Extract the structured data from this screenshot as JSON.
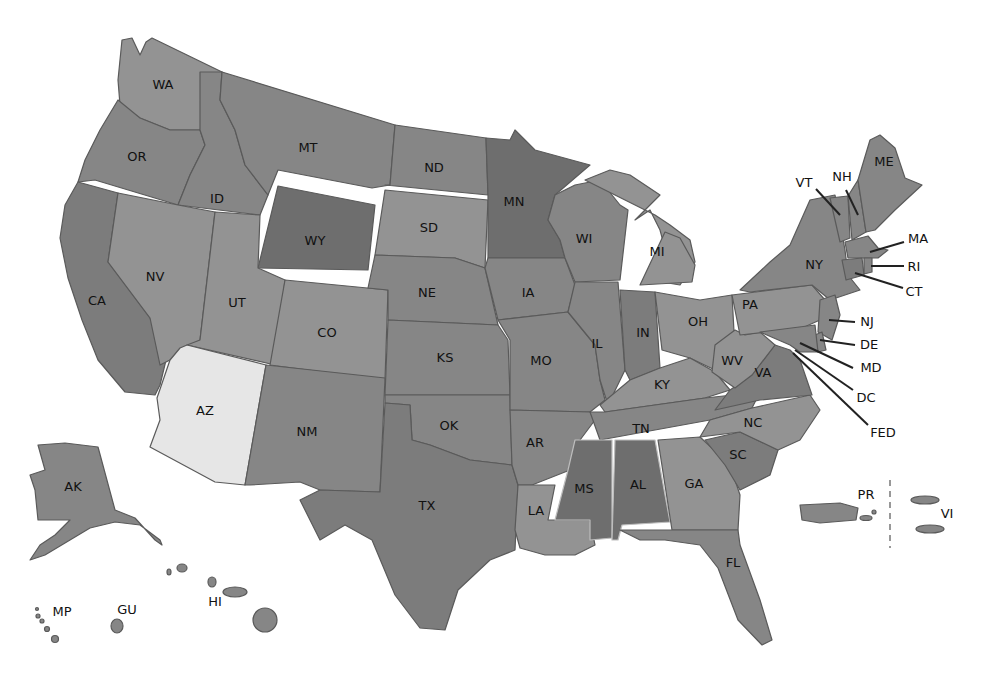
{
  "map": {
    "title": "",
    "shades": {
      "darkest": "#6e6e6e",
      "dark": "#7c7c7c",
      "medium": "#868686",
      "light": "#939393",
      "lightest": "#e6e6e6"
    },
    "states": [
      {
        "code": "WA",
        "shade": "light"
      },
      {
        "code": "OR",
        "shade": "medium"
      },
      {
        "code": "CA",
        "shade": "dark"
      },
      {
        "code": "ID",
        "shade": "medium"
      },
      {
        "code": "NV",
        "shade": "light"
      },
      {
        "code": "MT",
        "shade": "medium"
      },
      {
        "code": "WY",
        "shade": "darkest"
      },
      {
        "code": "UT",
        "shade": "light"
      },
      {
        "code": "AZ",
        "shade": "lightest"
      },
      {
        "code": "CO",
        "shade": "light"
      },
      {
        "code": "NM",
        "shade": "medium"
      },
      {
        "code": "ND",
        "shade": "medium"
      },
      {
        "code": "SD",
        "shade": "light"
      },
      {
        "code": "NE",
        "shade": "medium"
      },
      {
        "code": "KS",
        "shade": "medium"
      },
      {
        "code": "OK",
        "shade": "medium"
      },
      {
        "code": "TX",
        "shade": "dark"
      },
      {
        "code": "MN",
        "shade": "darkest"
      },
      {
        "code": "IA",
        "shade": "medium"
      },
      {
        "code": "MO",
        "shade": "medium"
      },
      {
        "code": "AR",
        "shade": "medium"
      },
      {
        "code": "LA",
        "shade": "light"
      },
      {
        "code": "WI",
        "shade": "medium"
      },
      {
        "code": "IL",
        "shade": "medium"
      },
      {
        "code": "MI",
        "shade": "light"
      },
      {
        "code": "IN",
        "shade": "dark"
      },
      {
        "code": "OH",
        "shade": "light"
      },
      {
        "code": "KY",
        "shade": "light"
      },
      {
        "code": "TN",
        "shade": "medium"
      },
      {
        "code": "MS",
        "shade": "darkest"
      },
      {
        "code": "AL",
        "shade": "darkest"
      },
      {
        "code": "GA",
        "shade": "light"
      },
      {
        "code": "FL",
        "shade": "medium"
      },
      {
        "code": "SC",
        "shade": "dark"
      },
      {
        "code": "NC",
        "shade": "light"
      },
      {
        "code": "VA",
        "shade": "dark"
      },
      {
        "code": "WV",
        "shade": "light"
      },
      {
        "code": "PA",
        "shade": "light"
      },
      {
        "code": "NY",
        "shade": "medium"
      },
      {
        "code": "VT",
        "shade": "medium"
      },
      {
        "code": "NH",
        "shade": "medium"
      },
      {
        "code": "ME",
        "shade": "medium"
      },
      {
        "code": "MA",
        "shade": "medium"
      },
      {
        "code": "RI",
        "shade": "medium"
      },
      {
        "code": "CT",
        "shade": "dark"
      },
      {
        "code": "NJ",
        "shade": "medium"
      },
      {
        "code": "DE",
        "shade": "medium"
      },
      {
        "code": "MD",
        "shade": "medium"
      },
      {
        "code": "DC",
        "shade": "medium"
      },
      {
        "code": "AK",
        "shade": "medium"
      },
      {
        "code": "HI",
        "shade": "medium"
      },
      {
        "code": "PR",
        "shade": "medium"
      },
      {
        "code": "VI",
        "shade": "medium"
      },
      {
        "code": "GU",
        "shade": "medium"
      },
      {
        "code": "MP",
        "shade": "medium"
      }
    ],
    "labels": {
      "WA": "WA",
      "OR": "OR",
      "CA": "CA",
      "ID": "ID",
      "NV": "NV",
      "MT": "MT",
      "WY": "WY",
      "UT": "UT",
      "AZ": "AZ",
      "CO": "CO",
      "NM": "NM",
      "ND": "ND",
      "SD": "SD",
      "NE": "NE",
      "KS": "KS",
      "OK": "OK",
      "TX": "TX",
      "MN": "MN",
      "IA": "IA",
      "MO": "MO",
      "AR": "AR",
      "LA": "LA",
      "WI": "WI",
      "IL": "IL",
      "MI": "MI",
      "IN": "IN",
      "OH": "OH",
      "KY": "KY",
      "TN": "TN",
      "MS": "MS",
      "AL": "AL",
      "GA": "GA",
      "FL": "FL",
      "SC": "SC",
      "NC": "NC",
      "VA": "VA",
      "WV": "WV",
      "PA": "PA",
      "NY": "NY",
      "VT": "VT",
      "NH": "NH",
      "ME": "ME",
      "MA": "MA",
      "RI": "RI",
      "CT": "CT",
      "NJ": "NJ",
      "DE": "DE",
      "MD": "MD",
      "DC": "DC",
      "FED": "FED",
      "AK": "AK",
      "HI": "HI",
      "PR": "PR",
      "VI": "VI",
      "GU": "GU",
      "MP": "MP"
    }
  }
}
